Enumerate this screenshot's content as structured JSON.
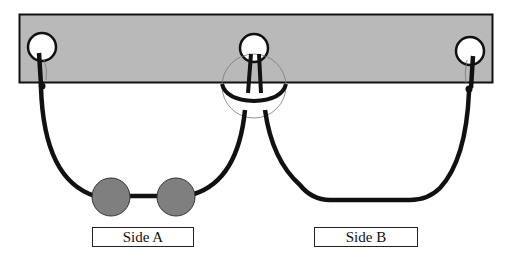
{
  "diagram": {
    "colors": {
      "bar_fill": "#b9b9b9",
      "bead_fill": "#7f7f7f",
      "cord": "#111111",
      "hole_fill": "#ffffff"
    },
    "holes": [
      "left-hole",
      "middle-hole",
      "right-hole"
    ],
    "beads": {
      "side_a_count": 2,
      "side_b_count": 0
    },
    "labels": {
      "side_a": "Side A",
      "side_b": "Side B"
    }
  }
}
